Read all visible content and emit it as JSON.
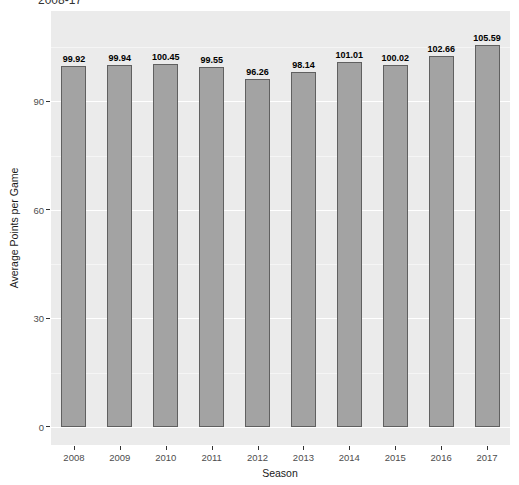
{
  "chart_data": {
    "type": "bar",
    "title": "2008-17",
    "xlabel": "Season",
    "ylabel": "Average Points per Game",
    "categories": [
      "2008",
      "2009",
      "2010",
      "2011",
      "2012",
      "2013",
      "2014",
      "2015",
      "2016",
      "2017"
    ],
    "values": [
      99.92,
      99.94,
      100.45,
      99.55,
      96.26,
      98.14,
      101.01,
      100.02,
      102.66,
      105.59
    ],
    "value_labels": [
      "99.92",
      "99.94",
      "100.45",
      "99.55",
      "96.26",
      "98.14",
      "101.01",
      "100.02",
      "102.66",
      "105.59"
    ],
    "ylim": [
      -5,
      115
    ],
    "yticks": [
      0,
      30,
      60,
      90
    ],
    "yticks_minor": [
      15,
      45,
      75,
      105
    ],
    "grid": "on",
    "legend": "none",
    "colors": {
      "panel_bg": "#ebebeb",
      "grid_major": "#ffffff",
      "grid_minor": "#f5f5f5",
      "bar_fill": "#a3a3a3",
      "bar_border": "#606060",
      "tick_text": "#4d4d4d",
      "axis_title_text": "#1a1a1a",
      "value_label_text": "#000000"
    }
  }
}
